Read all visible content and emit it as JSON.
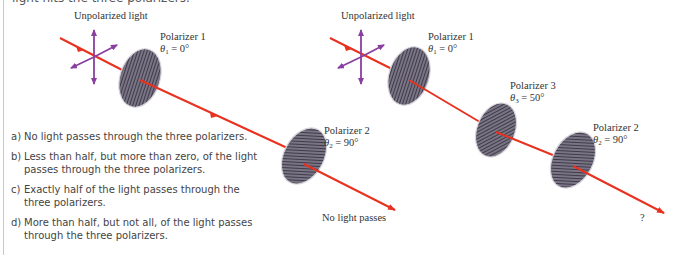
{
  "header": {
    "cutoff_text": "light hits the three polarizers."
  },
  "left_diagram": {
    "source_label": "Unpolarized light",
    "polarizers": [
      {
        "name": "Polarizer 1",
        "theta_symbol": "θ",
        "theta_index": "1",
        "theta_value": " = 0°",
        "stripes": "vertical"
      },
      {
        "name": "Polarizer 2",
        "theta_symbol": "θ",
        "theta_index": "2",
        "theta_value": " = 90°",
        "stripes": "horizontal"
      }
    ],
    "result_label": "No light passes"
  },
  "right_diagram": {
    "source_label": "Unpolarized light",
    "polarizers": [
      {
        "name": "Polarizer 1",
        "theta_symbol": "θ",
        "theta_index": "1",
        "theta_value": " = 0°",
        "stripes": "vertical"
      },
      {
        "name": "Polarizer 3",
        "theta_symbol": "θ",
        "theta_index": "3",
        "theta_value": " = 50°",
        "stripes": "diagonal"
      },
      {
        "name": "Polarizer 2",
        "theta_symbol": "θ",
        "theta_index": "2",
        "theta_value": " = 90°",
        "stripes": "horizontal"
      }
    ],
    "result_label": "?"
  },
  "options": [
    {
      "key": "a)",
      "text": "No light passes through the three polarizers."
    },
    {
      "key": "b)",
      "text": "Less than half, but more than zero, of the light passes through the three polarizers."
    },
    {
      "key": "c)",
      "text": "Exactly half of the light passes through the three polarizers."
    },
    {
      "key": "d)",
      "text": "More than half, but not all, of the light passes through the three polarizers."
    }
  ],
  "colors": {
    "ray": "#e8311f",
    "polarization_arrows": "#8a3fa0",
    "disc_fill": "#7a7585",
    "disc_stripe": "#3f3a4a",
    "disc_edge": "#d8d6dc"
  }
}
